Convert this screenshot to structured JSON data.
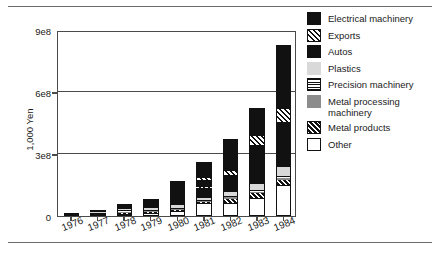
{
  "chart_data": {
    "type": "bar",
    "subtype": "stacked-bar",
    "title": "",
    "xlabel": "",
    "ylabel": "1,000 Yen",
    "categories": [
      "1976",
      "1977",
      "1978",
      "1979",
      "1980",
      "1981",
      "1982",
      "1983",
      "1984"
    ],
    "ylim": [
      0,
      900000000
    ],
    "ytick_labels": [
      "0",
      "3e8",
      "6e8",
      "9e8"
    ],
    "ytick_values": [
      0,
      300000000,
      600000000,
      900000000
    ],
    "grid": "horizontal",
    "legend_position": "right",
    "stack_order_bottom_to_top": [
      "Other",
      "Metal products",
      "Metal processing machinery",
      "Precision machinery",
      "Plastics",
      "Autos",
      "Exports",
      "Electrical machinery"
    ],
    "series": [
      {
        "name": "Electrical machinery",
        "pattern": "solid-black",
        "color": "#111111",
        "values": [
          4000000,
          9000000,
          22000000,
          36000000,
          96000000,
          77000000,
          152000000,
          140000000,
          310000000
        ]
      },
      {
        "name": "Exports",
        "pattern": "hatch-light",
        "color": "#ffffff",
        "values": [
          0,
          0,
          0,
          0,
          0,
          10000000,
          20000000,
          42000000,
          60000000
        ]
      },
      {
        "name": "Autos",
        "pattern": "solid-black",
        "color": "#111111",
        "values": [
          0,
          0,
          4000000,
          9000000,
          19000000,
          86000000,
          82000000,
          190000000,
          220000000
        ]
      },
      {
        "name": "Plastics",
        "pattern": "light-gray",
        "color": "#d9d9d9",
        "values": [
          0,
          2000000,
          5000000,
          9000000,
          14000000,
          10000000,
          20000000,
          25000000,
          40000000
        ]
      },
      {
        "name": "Precision machinery",
        "pattern": "horizontal-lines",
        "color": "#ffffff",
        "values": [
          0,
          2000000,
          4000000,
          5000000,
          6000000,
          6000000,
          7000000,
          10000000,
          12000000
        ]
      },
      {
        "name": "Metal processing machinery",
        "pattern": "mid-gray",
        "color": "#8c8c8c",
        "values": [
          0,
          0,
          2000000,
          3000000,
          4000000,
          4000000,
          5000000,
          6000000,
          10000000
        ]
      },
      {
        "name": "Metal products",
        "pattern": "hatch-dark",
        "color": "#111111",
        "values": [
          0,
          0,
          2000000,
          3000000,
          4000000,
          5000000,
          22000000,
          25000000,
          22000000
        ]
      },
      {
        "name": "Other",
        "pattern": "white",
        "color": "#ffffff",
        "values": [
          2000000,
          4000000,
          8000000,
          13000000,
          22000000,
          62000000,
          62000000,
          87000000,
          152000000
        ]
      }
    ],
    "totals": [
      6000000,
      17000000,
      47000000,
      78000000,
      165000000,
      260000000,
      370000000,
      525000000,
      826000000
    ]
  },
  "axes": {
    "yticks": [
      {
        "label": "9e8",
        "value": 900000000
      },
      {
        "label": "6e8",
        "value": 600000000
      },
      {
        "label": "3e8",
        "value": 300000000
      },
      {
        "label": "0",
        "value": 0
      }
    ],
    "ylabel": "1,000 Yen",
    "xticks": [
      "1976",
      "1977",
      "1978",
      "1979",
      "1980",
      "1981",
      "1982",
      "1983",
      "1984"
    ]
  },
  "legend": {
    "items": [
      {
        "label": "Electrical machinery",
        "swatch": "solid-black"
      },
      {
        "label": "Exports",
        "swatch": "hatch-light"
      },
      {
        "label": "Autos",
        "swatch": "solid-black"
      },
      {
        "label": "Plastics",
        "swatch": "light-gray"
      },
      {
        "label": "Precision machinery",
        "swatch": "horizontal-lines"
      },
      {
        "label": "Metal processing machinery",
        "swatch": "mid-gray"
      },
      {
        "label": "Metal products",
        "swatch": "hatch-dark"
      },
      {
        "label": "Other",
        "swatch": "white"
      }
    ]
  },
  "style": {
    "background": "#ffffff",
    "axis_color": "#4a4a4a",
    "rule_color": "#6b6b6b",
    "text_color": "#1a1a1a",
    "black": "#111111",
    "light_gray": "#d9d9d9",
    "mid_gray": "#8c8c8c"
  }
}
